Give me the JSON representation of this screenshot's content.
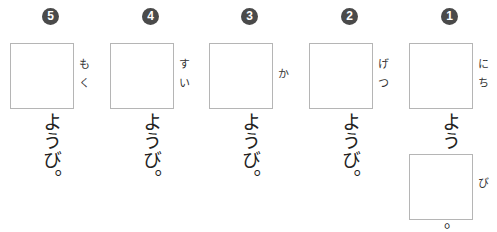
{
  "worksheet": {
    "columns": [
      {
        "number": "5",
        "furigana": "もく",
        "okurigana": "ようび。"
      },
      {
        "number": "4",
        "furigana": "すい",
        "okurigana": "ようび。"
      },
      {
        "number": "3",
        "furigana": "か",
        "okurigana": "ようび。"
      },
      {
        "number": "2",
        "furigana": "げつ",
        "okurigana": "ようび。"
      },
      {
        "number": "1",
        "furigana": "にち",
        "okurigana": "よう",
        "second_box_furigana": "び",
        "trailing_punctuation": "。"
      }
    ]
  },
  "colors": {
    "badge_bg": "#4a4a4a",
    "box_border": "#b5b5b5"
  }
}
